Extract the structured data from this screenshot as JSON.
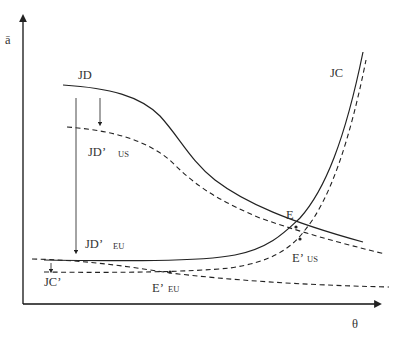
{
  "axes": {
    "y_label": "ā",
    "x_label": "θ"
  },
  "curves": {
    "jd": {
      "label": "JD",
      "style": "solid"
    },
    "jd_us": {
      "label_main": "JD’",
      "label_sub": "US",
      "style": "dashed"
    },
    "jd_eu": {
      "label_main": "JD’",
      "label_sub": "EU",
      "style": "dashed"
    },
    "jc": {
      "label": "JC",
      "style": "solid"
    },
    "jc_prime": {
      "label": "JC’",
      "style": "dashed"
    }
  },
  "points": {
    "e": {
      "label": "E"
    },
    "e_us": {
      "label_main": "E’",
      "label_sub": "US"
    },
    "e_eu": {
      "label_main": "E’",
      "label_sub": "EU"
    }
  },
  "colors": {
    "line": "#222222",
    "text": "#333333",
    "background": "#ffffff"
  }
}
